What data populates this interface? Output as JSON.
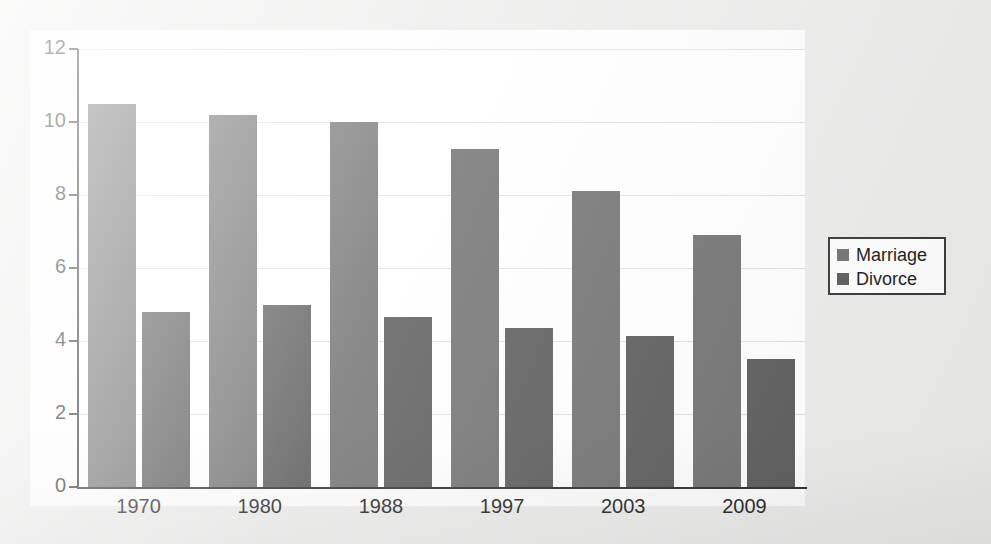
{
  "chart_data": {
    "type": "bar",
    "title": "",
    "subtitle": "",
    "xlabel": "",
    "ylabel": "",
    "categories": [
      "1970",
      "1980",
      "1988",
      "1997",
      "2003",
      "2009"
    ],
    "series": [
      {
        "name": "Marriage",
        "color": "#6f6f6f",
        "values": [
          10.5,
          10.2,
          10.0,
          9.25,
          8.1,
          6.9
        ]
      },
      {
        "name": "Divorce",
        "color": "#585858",
        "values": [
          4.8,
          5.0,
          4.65,
          4.35,
          4.15,
          3.5
        ]
      }
    ],
    "ylim": [
      0,
      12
    ],
    "ytick_values": [
      0,
      2,
      4,
      6,
      8,
      10,
      12
    ],
    "ytick_labels": [
      "0",
      "2",
      "4",
      "6",
      "8",
      "10",
      "12"
    ],
    "grid": true,
    "grid_axis": "y",
    "legend_position": "right"
  },
  "legend": {
    "entries": [
      {
        "label": "Marriage",
        "swatch": "marriage-swatch"
      },
      {
        "label": "Divorce",
        "swatch": "divorce-swatch"
      }
    ]
  },
  "scan_artifacts": {
    "ghost_lines": [
      "in the number of marriages",
      "of couples choosing to live",
      "rates have also declined",
      "as shown in the figure below."
    ]
  }
}
